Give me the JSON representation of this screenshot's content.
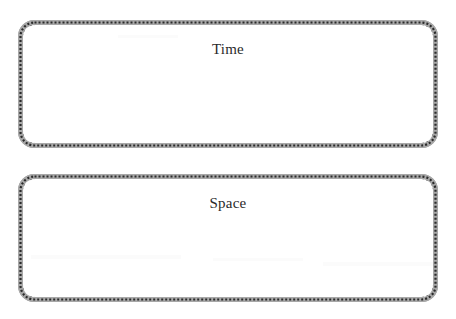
{
  "page": {
    "background_color": "#ffffff",
    "width": 456,
    "height": 319
  },
  "style": {
    "border_dot_color": "#2b2b2b",
    "border_band_color": "#a8a8a8",
    "label_color": "#2a2a2a",
    "field_color": "#ffffff",
    "corner_radius_px": 16
  },
  "boxes": [
    {
      "id": "time",
      "label": "Time",
      "border_style": "dotted-square-band",
      "content": ""
    },
    {
      "id": "space",
      "label": "Space",
      "border_style": "dotted-square-band",
      "content": ""
    }
  ]
}
